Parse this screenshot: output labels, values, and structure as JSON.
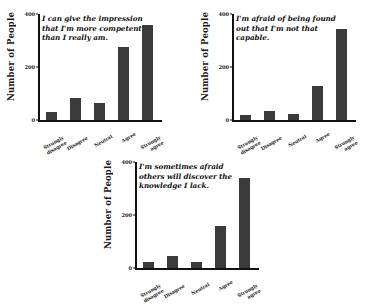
{
  "figure": {
    "background_color": "#ffffff",
    "bar_color": "#3b3b3b",
    "axis_color": "#111111"
  },
  "axis": {
    "ylabel": "Number of People",
    "yticks": [
      "400",
      "200",
      "0"
    ],
    "ytick_values": [
      400,
      200,
      0
    ],
    "categories": [
      "Strongly disagree",
      "Disagree",
      "Neutral",
      "Agree",
      "Strongly agree"
    ]
  },
  "chart_data": [
    {
      "type": "bar",
      "title": "I can give the impression that I'm more competent than I really am.",
      "categories": [
        "Strongly disagree",
        "Disagree",
        "Neutral",
        "Agree",
        "Strongly agree"
      ],
      "values": [
        30,
        85,
        65,
        275,
        360
      ],
      "xlabel": "",
      "ylabel": "Number of People",
      "ylim": [
        0,
        400
      ],
      "yticks": [
        0,
        200,
        400
      ],
      "grid": false,
      "legend": false
    },
    {
      "type": "bar",
      "title": "I'm afraid of being found out that I'm not that capable.",
      "categories": [
        "Strongly disagree",
        "Disagree",
        "Neutral",
        "Agree",
        "Strongly agree"
      ],
      "values": [
        20,
        35,
        25,
        130,
        345
      ],
      "xlabel": "",
      "ylabel": "Number of People",
      "ylim": [
        0,
        400
      ],
      "yticks": [
        0,
        200,
        400
      ],
      "grid": false,
      "legend": false
    },
    {
      "type": "bar",
      "title": "I'm sometimes afraid others will discover the knowledge I lack.",
      "categories": [
        "Strongly disagree",
        "Disagree",
        "Neutral",
        "Agree",
        "Strongly agree"
      ],
      "values": [
        25,
        45,
        25,
        160,
        340
      ],
      "xlabel": "",
      "ylabel": "Number of People",
      "ylim": [
        0,
        400
      ],
      "yticks": [
        0,
        200,
        400
      ],
      "grid": false,
      "legend": false
    }
  ]
}
